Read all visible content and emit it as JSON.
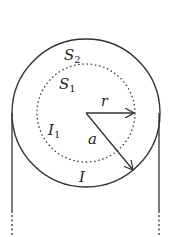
{
  "diagram": {
    "type": "physics-figure",
    "colors": {
      "stroke": "#333333",
      "background": "#ffffff"
    },
    "outer_circle": {
      "cx": 86,
      "cy": 113,
      "r": 74,
      "style": "solid"
    },
    "inner_circle": {
      "cx": 86,
      "cy": 113,
      "r": 49,
      "style": "dotted"
    },
    "labels": {
      "S2": {
        "main": "S",
        "sub": "2"
      },
      "S1": {
        "main": "S",
        "sub": "1"
      },
      "r": "r",
      "a": "a",
      "I1": {
        "main": "I",
        "sub": "1"
      },
      "I": "I"
    },
    "arrows": [
      {
        "name": "radius-r-arrow",
        "label": "r",
        "from": [
          86,
          113
        ],
        "to": [
          135,
          113
        ]
      },
      {
        "name": "radius-a-arrow",
        "label": "a",
        "from": [
          86,
          113
        ],
        "to": [
          133,
          170
        ]
      }
    ],
    "side_lines": [
      {
        "name": "left-wire-edge",
        "x": 12,
        "solid_to": 213,
        "dotted_to": 237
      },
      {
        "name": "right-wire-edge",
        "x": 159,
        "solid_to": 213,
        "dotted_to": 237
      }
    ]
  }
}
